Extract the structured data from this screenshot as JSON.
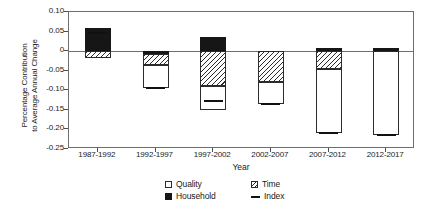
{
  "chart_data": {
    "type": "bar",
    "title": "",
    "xlabel": "Year",
    "ylabel_line1": "Percentage Contribution",
    "ylabel_line2": "to Average Annual Change",
    "categories": [
      "1987-1992",
      "1992-1997",
      "1997-2002",
      "2002-2007",
      "2007-2012",
      "2012-2017"
    ],
    "ylim": [
      -0.25,
      0.1
    ],
    "yticks": [
      "0.10",
      "0.05",
      "0",
      "-0.05",
      "-0.10",
      "-0.15",
      "-0.20",
      "-0.25"
    ],
    "ytick_values": [
      0.1,
      0.05,
      0,
      -0.05,
      -0.1,
      -0.15,
      -0.2,
      -0.25
    ],
    "grid": false,
    "legend_position": "bottom",
    "stacked": true,
    "series": [
      {
        "name": "Quality",
        "values": [
          0.0,
          -0.06,
          -0.06,
          -0.055,
          -0.165,
          -0.215
        ]
      },
      {
        "name": "Household",
        "values": [
          0.06,
          -0.007,
          0.035,
          0.0,
          0.008,
          0.008
        ]
      },
      {
        "name": "Time",
        "values": [
          -0.017,
          -0.028,
          -0.09,
          -0.08,
          -0.045,
          0.0
        ]
      }
    ],
    "index": {
      "name": "Index",
      "values": [
        0.047,
        -0.095,
        -0.127,
        -0.135,
        -0.21,
        -0.215
      ]
    },
    "bars": [
      {
        "category": "1987-1992",
        "segments": [
          {
            "series": "Household",
            "from": 0.0,
            "to": 0.06
          },
          {
            "series": "Time",
            "from": -0.017,
            "to": 0.0
          }
        ],
        "index": 0.047
      },
      {
        "category": "1992-1997",
        "segments": [
          {
            "series": "Household",
            "from": -0.007,
            "to": 0.0
          },
          {
            "series": "Time",
            "from": -0.035,
            "to": -0.007
          },
          {
            "series": "Quality",
            "from": -0.095,
            "to": -0.035
          }
        ],
        "index": -0.095
      },
      {
        "category": "1997-2002",
        "segments": [
          {
            "series": "Household",
            "from": 0.0,
            "to": 0.035
          },
          {
            "series": "Time",
            "from": -0.09,
            "to": 0.0
          },
          {
            "series": "Quality",
            "from": -0.15,
            "to": -0.09
          }
        ],
        "index": -0.127
      },
      {
        "category": "2002-2007",
        "segments": [
          {
            "series": "Time",
            "from": -0.08,
            "to": 0.0
          },
          {
            "series": "Quality",
            "from": -0.135,
            "to": -0.08
          }
        ],
        "index": -0.135
      },
      {
        "category": "2007-2012",
        "segments": [
          {
            "series": "Household",
            "from": 0.0,
            "to": 0.008
          },
          {
            "series": "Time",
            "from": -0.045,
            "to": 0.0
          },
          {
            "series": "Quality",
            "from": -0.21,
            "to": -0.045
          }
        ],
        "index": -0.21
      },
      {
        "category": "2012-2017",
        "segments": [
          {
            "series": "Household",
            "from": 0.0,
            "to": 0.008
          },
          {
            "series": "Quality",
            "from": -0.215,
            "to": 0.0
          }
        ],
        "index": -0.215
      }
    ],
    "legend": [
      {
        "label": "Quality",
        "key": "quality-swatch"
      },
      {
        "label": "Household",
        "key": "household-swatch"
      },
      {
        "label": "Time",
        "key": "time-swatch"
      },
      {
        "label": "Index",
        "key": "index-line-swatch"
      }
    ],
    "colors": {
      "quality": "#ffffff",
      "household": "#161616",
      "time_hatch": "#2b2b2b",
      "axis": "#6e6e6e",
      "index": "#111111"
    }
  }
}
